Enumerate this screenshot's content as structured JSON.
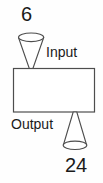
{
  "diagram": {
    "type": "function-machine",
    "title": "",
    "input_value": "6",
    "input_label": "Input",
    "output_label": "Output",
    "output_value": "24",
    "colors": {
      "stroke": "#4d4d4d",
      "machine_fill": "#ffffff",
      "background": "#fefefe",
      "text": "#1a1a1a"
    },
    "parts": {
      "input_funnel": "input-funnel",
      "machine_box": "machine-box",
      "output_funnel": "output-funnel"
    }
  }
}
